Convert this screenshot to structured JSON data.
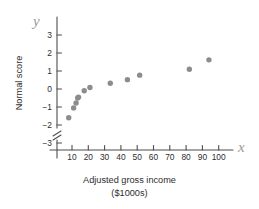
{
  "chart_data": {
    "type": "scatter",
    "title": "",
    "xlabel": "Adjusted gross income",
    "xlabel_units": "($1000s)",
    "ylabel": "Normal score",
    "x_axis_symbol": "x",
    "y_axis_symbol": "y",
    "xlim": [
      0,
      105
    ],
    "ylim": [
      -3.6,
      3.4
    ],
    "grid": false,
    "legend": null,
    "y_axis_break": true,
    "xticks": [
      10,
      20,
      30,
      40,
      50,
      60,
      70,
      80,
      90,
      100
    ],
    "xtick_labels": [
      "10",
      "20",
      "30",
      "40",
      "50",
      "60",
      "70",
      "80",
      "90",
      "100"
    ],
    "yticks": [
      3,
      2,
      1,
      0,
      -1,
      -2,
      -3
    ],
    "ytick_labels": [
      "3",
      "2",
      "1",
      "0",
      "−1",
      "−2",
      "−3"
    ],
    "marker_color": "#8c8c8c",
    "axis_color": "#4d4d4d",
    "x": [
      8.0,
      11.0,
      12.5,
      13.5,
      14.0,
      17.5,
      21.0,
      33.5,
      44.0,
      51.5,
      82.0,
      94.0
    ],
    "y": [
      -1.6,
      -1.05,
      -0.78,
      -0.5,
      -0.45,
      -0.1,
      0.08,
      0.32,
      0.52,
      0.77,
      1.1,
      1.62
    ],
    "points": [
      {
        "x": 8.0,
        "y": -1.6
      },
      {
        "x": 11.0,
        "y": -1.05
      },
      {
        "x": 12.5,
        "y": -0.78
      },
      {
        "x": 13.5,
        "y": -0.5
      },
      {
        "x": 14.0,
        "y": -0.45
      },
      {
        "x": 17.5,
        "y": -0.1
      },
      {
        "x": 21.0,
        "y": 0.08
      },
      {
        "x": 33.5,
        "y": 0.32
      },
      {
        "x": 44.0,
        "y": 0.52
      },
      {
        "x": 51.5,
        "y": 0.77
      },
      {
        "x": 82.0,
        "y": 1.1
      },
      {
        "x": 94.0,
        "y": 1.62
      }
    ]
  },
  "labels": {
    "ylabel_text": "Normal score",
    "xlabel_line1": "Adjusted gross income",
    "xlabel_line2": "($1000s)"
  }
}
